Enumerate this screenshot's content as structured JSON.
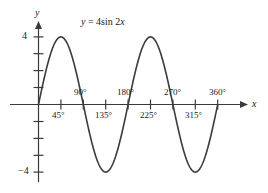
{
  "figure": {
    "equation_label": "y = 4 sin 2x",
    "equation_parts": {
      "y": "y",
      "equals": "=",
      "amplitude": "4",
      "func": "sin",
      "coefficient": "2",
      "variable": "x"
    },
    "x_axis_name": "x",
    "y_axis_name": "y",
    "line_color": "#3b3b3b",
    "axis_color": "#3b3b3b",
    "background": "#ffffff"
  },
  "chart_data": {
    "type": "line",
    "xlabel": "x",
    "ylabel": "y",
    "xlim": [
      0,
      405
    ],
    "ylim": [
      -4.6,
      4.6
    ],
    "grid": false,
    "legend": null,
    "x_unit": "degrees",
    "x_tick_labels_above": [
      "90°",
      "180°",
      "270°",
      "360°"
    ],
    "x_tick_labels_below": [
      "45°",
      "135°",
      "225°",
      "315°"
    ],
    "x_ticks": [
      45,
      90,
      135,
      180,
      225,
      270,
      315,
      360
    ],
    "x_tick_labels": [
      "45°",
      "90°",
      "135°",
      "180°",
      "225°",
      "270°",
      "315°",
      "360°"
    ],
    "y_ticks": [
      -4,
      -3,
      -2,
      -1,
      1,
      2,
      3,
      4
    ],
    "y_tick_labels_shown": [
      "4",
      "-4"
    ],
    "y_label_top": "4",
    "y_label_bottom": "−4",
    "amplitude": 4,
    "period_degrees": 180,
    "series": [
      {
        "name": "y = 4 sin 2x",
        "x": [
          0,
          15,
          30,
          45,
          60,
          75,
          90,
          105,
          120,
          135,
          150,
          165,
          180,
          195,
          210,
          225,
          240,
          255,
          270,
          285,
          300,
          315,
          330,
          345,
          360
        ],
        "values": [
          0,
          2,
          3.46,
          4,
          3.46,
          2,
          0,
          -2,
          -3.46,
          -4,
          -3.46,
          -2,
          0,
          2,
          3.46,
          4,
          3.46,
          2,
          0,
          -2,
          -3.46,
          -4,
          -3.46,
          -2,
          0
        ]
      }
    ],
    "annotations": [
      {
        "text": "y = 4 sin 2x",
        "x": 110,
        "y": 4.4
      }
    ],
    "key_points": {
      "maxima_degrees": [
        45,
        225
      ],
      "minima_degrees": [
        135,
        315
      ],
      "zeros_degrees": [
        0,
        90,
        180,
        270,
        360
      ]
    }
  }
}
